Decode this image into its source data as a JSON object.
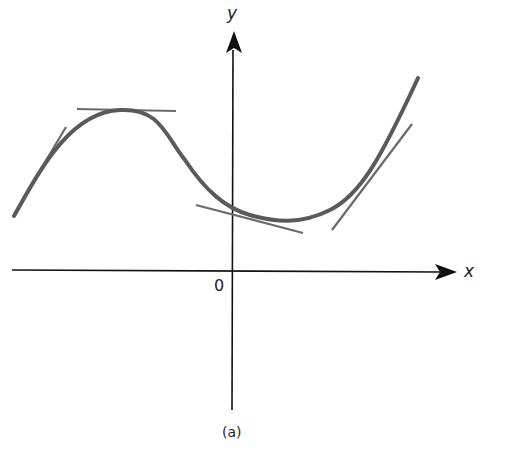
{
  "figure": {
    "caption": "(a)",
    "x_axis_label": "x",
    "y_axis_label": "y",
    "origin_label": "0",
    "curve_color": "#5a5a5a",
    "axis_color": "#111111"
  }
}
